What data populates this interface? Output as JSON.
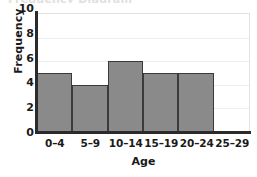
{
  "clipped_top_text": "Frequency Diagram",
  "chart_data": {
    "type": "bar",
    "title": "",
    "xlabel": "Age",
    "ylabel": "Frequency",
    "categories": [
      "0–4",
      "5–9",
      "10–14",
      "15–19",
      "20–24",
      "25–29"
    ],
    "values": [
      5,
      4,
      6,
      5,
      5,
      0
    ],
    "ylim": [
      0,
      10
    ],
    "yticks": [
      0,
      2,
      4,
      6,
      8,
      10
    ],
    "ytick_labels": [
      "0",
      "2",
      "4",
      "6",
      "8",
      "10"
    ],
    "grid": true,
    "legend": null,
    "colors": {
      "bar_fill": "#8a8a8a",
      "bar_edge": "#3a3a3a",
      "axis": "#2b2b2b",
      "gridline": "#ededed",
      "text": "#1a1a1a",
      "background": "#ffffff"
    }
  }
}
